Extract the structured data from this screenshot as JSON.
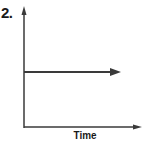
{
  "figure": {
    "number_label": "2.",
    "x_axis_label": "Time",
    "y_axis_label": "",
    "colors": {
      "line": "#3a3a3a",
      "axis": "#3a3a3a",
      "text": "#1a1a1a"
    }
  },
  "diagram": {
    "type": "graph-sketch",
    "elements": [
      {
        "kind": "y-axis",
        "arrow": "up"
      },
      {
        "kind": "x-axis",
        "arrow": "right",
        "label": "Time"
      },
      {
        "kind": "horizontal-line",
        "arrow": "right",
        "relative_height": 0.5
      }
    ]
  }
}
